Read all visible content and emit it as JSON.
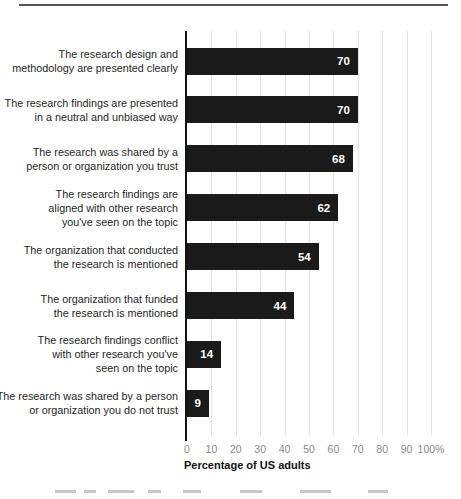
{
  "chart_data": {
    "type": "bar",
    "orientation": "horizontal",
    "title": "",
    "xlabel": "Percentage of US adults",
    "ylabel": "",
    "xlim": [
      0,
      100
    ],
    "grid": "vertical light-gray gridlines every 10 units",
    "legend": "none",
    "categories": [
      "The research design and methodology are presented clearly",
      "The research findings are presented in a neutral and unbiased way",
      "The research was shared by a person or organization you trust",
      "The research findings are aligned with other research you've seen on the topic",
      "The organization that conducted the research is mentioned",
      "The organization that funded the research is mentioned",
      "The research findings conflict with other research you've seen on the topic",
      "The research was shared by a person or organization you do not trust"
    ],
    "category_lines": [
      [
        "The research design and",
        "methodology are presented clearly"
      ],
      [
        "The research findings are presented",
        "in a neutral and unbiased way"
      ],
      [
        "The research was shared by a",
        "person or organization you trust"
      ],
      [
        "The research findings are",
        "aligned with other research",
        "you've seen on the topic"
      ],
      [
        "The organization that conducted",
        "the research is mentioned"
      ],
      [
        "The organization that funded",
        "the research is mentioned"
      ],
      [
        "The research findings conflict",
        "with other research you've",
        "seen on the topic"
      ],
      [
        "The research was shared by a person",
        "or organization you do not trust"
      ]
    ],
    "values": [
      70,
      70,
      68,
      62,
      54,
      44,
      14,
      9
    ],
    "value_labels": [
      "70",
      "70",
      "68",
      "62",
      "54",
      "44",
      "14",
      "9"
    ],
    "x_ticks": [
      "0",
      "10",
      "20",
      "30",
      "40",
      "50",
      "60",
      "70",
      "80",
      "90",
      "100%"
    ],
    "x_tick_values": [
      0,
      10,
      20,
      30,
      40,
      50,
      60,
      70,
      80,
      90,
      100
    ]
  },
  "colors": {
    "bar": "#1a1a1a",
    "value_label": "#ffffff",
    "gridline": "#e4e4e4",
    "axis_line": "#111111",
    "tick_text": "#8a8a8a",
    "category_text": "#1f1f1f",
    "top_rule": "#565656",
    "background": "#ffffff"
  }
}
